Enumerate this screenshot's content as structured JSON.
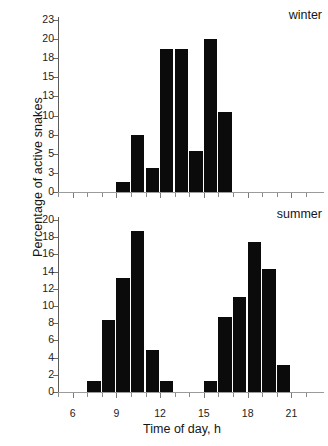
{
  "figure": {
    "ylabel": "Percentage of active snakes",
    "xlabel": "Time of day, h"
  },
  "chart_data": [
    {
      "type": "bar",
      "title": "winter",
      "panel": "top",
      "xlabel": "Time of day, h",
      "ylabel": "Percentage of active snakes",
      "xlim": [
        5,
        22
      ],
      "ylim": [
        0,
        23
      ],
      "ytick_labels": [
        "0",
        "3",
        "5",
        "8",
        "10",
        "13",
        "15",
        "18",
        "20",
        "23"
      ],
      "ytick_values": [
        0,
        3,
        5,
        8,
        10,
        13,
        15,
        18,
        20,
        23
      ],
      "xtick_labels": [
        "6",
        "9",
        "12",
        "15",
        "18",
        "21"
      ],
      "xtick_values": [
        6,
        9,
        12,
        15,
        18,
        21
      ],
      "grid": false,
      "bar_color": "#0b0b0b",
      "categories": [
        9,
        10,
        11,
        12,
        13,
        14,
        15,
        16
      ],
      "values": [
        1.5,
        8.0,
        3.5,
        19.0,
        19.0,
        5.5,
        20.0,
        10.5
      ]
    },
    {
      "type": "bar",
      "title": "summer",
      "panel": "bottom",
      "xlabel": "Time of day, h",
      "ylabel": "Percentage of active snakes",
      "xlim": [
        5,
        22
      ],
      "ylim": [
        0,
        20
      ],
      "ytick_labels": [
        "0",
        "2",
        "4",
        "6",
        "8",
        "10",
        "12",
        "14",
        "16",
        "18",
        "20"
      ],
      "ytick_values": [
        0,
        2,
        4,
        6,
        8,
        10,
        12,
        14,
        16,
        18,
        20
      ],
      "xtick_labels": [
        "6",
        "9",
        "12",
        "15",
        "18",
        "21"
      ],
      "xtick_values": [
        6,
        9,
        12,
        15,
        18,
        21
      ],
      "grid": false,
      "bar_color": "#0b0b0b",
      "categories": [
        7,
        8,
        9,
        10,
        11,
        12,
        15,
        16,
        17,
        18,
        19,
        20
      ],
      "values": [
        1.3,
        8.4,
        13.2,
        18.7,
        4.9,
        1.3,
        1.3,
        8.7,
        11.0,
        17.4,
        14.3,
        3.1
      ]
    }
  ]
}
